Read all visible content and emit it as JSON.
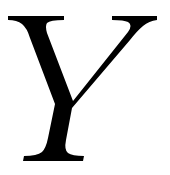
{
  "glyph": {
    "character": "Y",
    "style": "italic serif capital letter",
    "color": "#000000",
    "background": "#ffffff"
  }
}
